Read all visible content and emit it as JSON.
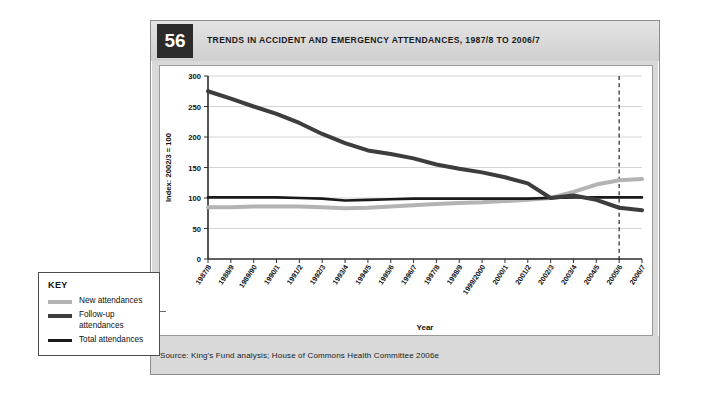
{
  "figure": {
    "number": "56",
    "title": "TRENDS IN ACCIDENT AND EMERGENCY ATTENDANCES, 1987/8 TO 2006/7",
    "source": "Source: King's Fund analysis; House of Commons Health Committee 2006e"
  },
  "key": {
    "title": "KEY",
    "items": [
      {
        "label": "New attendances",
        "color": "#b3b3b3"
      },
      {
        "label": "Follow-up attendances",
        "color": "#3d3d3d"
      },
      {
        "label": "Total attendances",
        "color": "#1a1a1a"
      }
    ]
  },
  "chart_data": {
    "type": "line",
    "title": "TRENDS IN ACCIDENT AND EMERGENCY ATTENDANCES, 1987/8 TO 2006/7",
    "xlabel": "Year",
    "ylabel": "Index: 2002/3 = 100",
    "ylim": [
      0,
      300
    ],
    "yticks": [
      0,
      50,
      100,
      150,
      200,
      250,
      300
    ],
    "grid": "horizontal",
    "legend_position": "external-left",
    "categories": [
      "1987/8",
      "1988/9",
      "1989/90",
      "1990/1",
      "1991/2",
      "1992/3",
      "1993/4",
      "1994/5",
      "1995/6",
      "1996/7",
      "1997/8",
      "1998/9",
      "1999/2000",
      "2000/1",
      "2001/2",
      "2002/3",
      "2003/4",
      "2004/5",
      "2005/6",
      "2006/7"
    ],
    "series": [
      {
        "name": "New attendances",
        "color": "#b3b3b3",
        "width": 4,
        "values": [
          85,
          85,
          86,
          86,
          86,
          85,
          83,
          84,
          86,
          88,
          90,
          92,
          93,
          95,
          97,
          100,
          110,
          122,
          129,
          131
        ]
      },
      {
        "name": "Follow-up attendances",
        "color": "#3d3d3d",
        "width": 4,
        "values": [
          275,
          263,
          250,
          238,
          223,
          205,
          190,
          178,
          172,
          165,
          155,
          148,
          142,
          134,
          124,
          100,
          104,
          97,
          84,
          80
        ]
      },
      {
        "name": "Total attendances",
        "color": "#1a1a1a",
        "width": 2.6,
        "values": [
          101,
          101,
          101,
          101,
          100,
          99,
          96,
          97,
          98,
          99,
          99,
          99,
          99,
          99,
          99,
          100,
          101,
          101,
          101,
          101
        ]
      }
    ],
    "annotations": [
      {
        "type": "vline",
        "at": "2005/6",
        "style": "dashed",
        "color": "#333333"
      }
    ]
  }
}
